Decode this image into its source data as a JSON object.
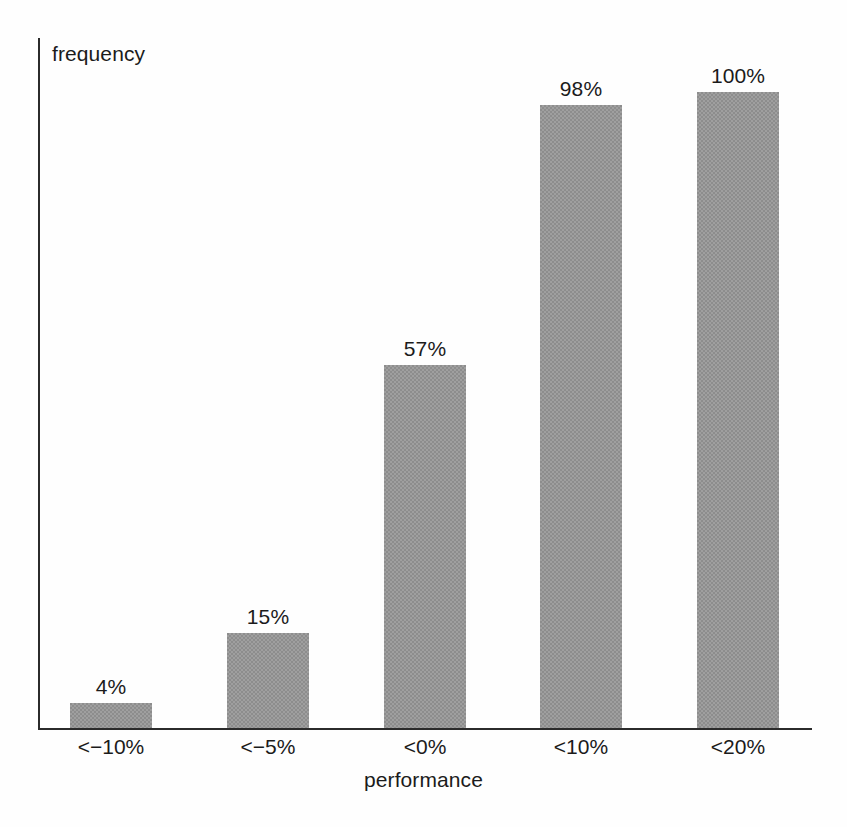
{
  "chart_data": {
    "type": "bar",
    "title": "",
    "subtitle": "",
    "xlabel": "performance",
    "ylabel": "frequency",
    "categories": [
      "<−10%",
      "<−5%",
      "<0%",
      "<10%",
      "<20%"
    ],
    "values": [
      4,
      15,
      57,
      98,
      100
    ],
    "value_labels": [
      "4%",
      "15%",
      "57%",
      "98%",
      "100%"
    ],
    "ylim": [
      0,
      100
    ],
    "grid": false,
    "legend": null,
    "y_tick_labels": [],
    "x_tick_labels": [
      "<−10%",
      "<−5%",
      "<0%",
      "<10%",
      "<20%"
    ],
    "bar_color": "#8d8d8d",
    "axis_color": "#2b2b2b",
    "background_color": "#fefefe",
    "annotations": []
  },
  "axes": {
    "y_title": "frequency",
    "x_title": "performance"
  },
  "bars": [
    {
      "category": "<−10%",
      "value": 4,
      "label": "4%"
    },
    {
      "category": "<−5%",
      "value": 15,
      "label": "15%"
    },
    {
      "category": "<0%",
      "value": 57,
      "label": "57%"
    },
    {
      "category": "<10%",
      "value": 98,
      "label": "98%"
    },
    {
      "category": "<20%",
      "value": 100,
      "label": "100%"
    }
  ]
}
